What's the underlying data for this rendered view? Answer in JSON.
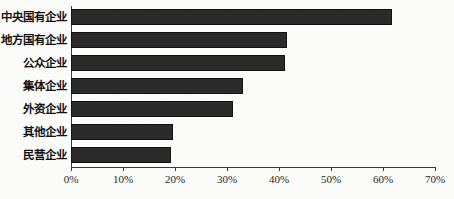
{
  "chart_data": {
    "type": "bar",
    "orientation": "horizontal",
    "title": "",
    "xlabel": "",
    "ylabel": "",
    "categories": [
      "中央国有企业",
      "地方国有企业",
      "公众企业",
      "集体企业",
      "外资企业",
      "其他企业",
      "民营企业"
    ],
    "values": [
      61.7,
      41.5,
      41.2,
      33.1,
      31.2,
      19.6,
      19.2
    ],
    "value_unit": "%",
    "xlim": [
      0,
      70
    ],
    "xticks": [
      0,
      10,
      20,
      30,
      40,
      50,
      60,
      70
    ],
    "xtick_labels": [
      "0%",
      "10%",
      "20%",
      "30%",
      "40%",
      "50%",
      "60%",
      "70%"
    ],
    "grid": false,
    "legend": "none",
    "series": [
      {
        "name": "",
        "values": [
          61.7,
          41.5,
          41.2,
          33.1,
          31.2,
          19.6,
          19.2
        ]
      }
    ],
    "colors": {
      "bar_fill": "#2b2b2b",
      "bar_border": "#111111",
      "axis": "#3a3a3a",
      "background": "#fbfbfa",
      "text": "#111111"
    }
  }
}
